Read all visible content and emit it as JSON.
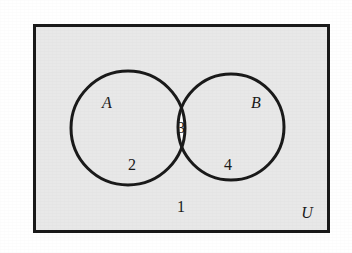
{
  "figure": {
    "kind": "venn-diagram",
    "set_count": 2,
    "universe_label": "U",
    "background_color": "#ffffff",
    "universe_fill": "#e8e8e8",
    "intersection_fill": "#fdfdfd",
    "stroke_color": "#1a1a1a",
    "rectangle": {
      "x": 33,
      "y": 24,
      "width": 297,
      "height": 209,
      "stroke_width": 3
    },
    "sets": [
      {
        "label": "A",
        "cx": 128,
        "cy": 128,
        "r": 57,
        "label_x": 107,
        "label_y": 108
      },
      {
        "label": "B",
        "cx": 231,
        "cy": 127,
        "r": 53,
        "label_x": 256,
        "label_y": 108
      }
    ],
    "universe_label_x": 307,
    "universe_label_y": 218
  },
  "regions": [
    {
      "id": "outside-both",
      "name": "A-complement-intersect-B-complement",
      "count": "1",
      "x": 181,
      "y": 212,
      "fill": "#e8e8e8"
    },
    {
      "id": "a-only",
      "name": "A-minus-B",
      "count": "2",
      "x": 132,
      "y": 170,
      "fill": "#e8e8e8"
    },
    {
      "id": "intersection",
      "name": "A-intersect-B",
      "count": "3",
      "x": 181,
      "y": 133,
      "fill": "#fdfdfd"
    },
    {
      "id": "b-only",
      "name": "B-minus-A",
      "count": "4",
      "x": 228,
      "y": 170,
      "fill": "#e8e8e8"
    }
  ],
  "chart_data": {
    "type": "venn",
    "title": "",
    "universe_label": "U",
    "set_labels": [
      "A",
      "B"
    ],
    "region_labels": {
      "only_A": "2",
      "only_B": "4",
      "A_and_B": "3",
      "neither": "1"
    },
    "values": [
      {
        "region": "neither",
        "label": "1"
      },
      {
        "region": "only_A",
        "label": "2"
      },
      {
        "region": "A_and_B",
        "label": "3"
      },
      {
        "region": "only_B",
        "label": "4"
      }
    ]
  }
}
